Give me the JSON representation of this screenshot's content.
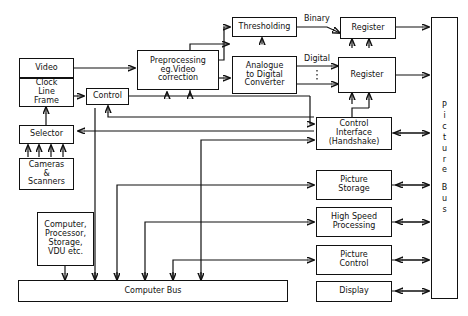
{
  "diagram": {
    "boxes": {
      "video": {
        "label": "Video"
      },
      "clock_line_frame": {
        "l1": "Clock",
        "l2": "Line",
        "l3": "Frame"
      },
      "selector": {
        "label": "Selector"
      },
      "cameras_scanners": {
        "l1": "Cameras",
        "l2": "&",
        "l3": "Scanners"
      },
      "computer_processor": {
        "l1": "Computer,",
        "l2": "Processor,",
        "l3": "Storage,",
        "l4": "VDU etc."
      },
      "control": {
        "label": "Control"
      },
      "preprocessing": {
        "l1": "Preprocessing",
        "l2": "eg.Video",
        "l3": "correction"
      },
      "thresholding": {
        "label": "Thresholding"
      },
      "adc": {
        "l1": "Analogue",
        "l2": "to Digital",
        "l3": "Converter"
      },
      "register_binary": {
        "label": "Register"
      },
      "register_digital": {
        "label": "Register"
      },
      "control_interface": {
        "l1": "Control",
        "l2": "Interface",
        "l3": "(Handshake)"
      },
      "picture_storage": {
        "l1": "Picture",
        "l2": "Storage"
      },
      "high_speed_processing": {
        "l1": "High Speed",
        "l2": "Processing"
      },
      "picture_control": {
        "l1": "Picture",
        "l2": "Control"
      },
      "display": {
        "label": "Display"
      },
      "computer_bus": {
        "label": "Computer  Bus"
      },
      "picture_bus": {
        "letters": [
          "P",
          "i",
          "c",
          "t",
          "u",
          "r",
          "e",
          "B",
          "u",
          "s"
        ]
      }
    },
    "signal_labels": {
      "binary": "Binary",
      "digital": "Digital"
    },
    "colors": {
      "line": "#111111",
      "background": "#ffffff"
    }
  }
}
